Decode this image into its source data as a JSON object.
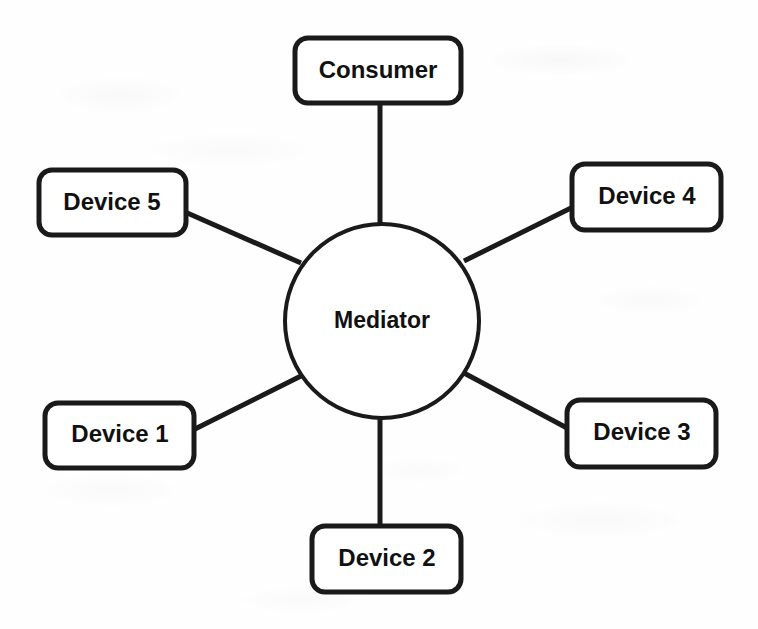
{
  "diagram": {
    "type": "hub-and-spoke",
    "background_color": "#fefefe",
    "stroke_color": "#1a1a1a",
    "fill_color": "#ffffff",
    "hub": {
      "label": "Mediator",
      "shape": "circle",
      "cx": 382,
      "cy": 321,
      "r": 97,
      "stroke_width": 4,
      "font_size": 23
    },
    "nodes": [
      {
        "id": "consumer",
        "label": "Consumer",
        "shape": "rounded-rect",
        "x": 295,
        "y": 38,
        "w": 166,
        "h": 65,
        "rx": 13,
        "stroke_width": 5,
        "font_size": 24
      },
      {
        "id": "device-5",
        "label": "Device 5",
        "shape": "rounded-rect",
        "x": 39,
        "y": 170,
        "w": 147,
        "h": 65,
        "rx": 13,
        "stroke_width": 5,
        "font_size": 24
      },
      {
        "id": "device-4",
        "label": "Device 4",
        "shape": "rounded-rect",
        "x": 572,
        "y": 164,
        "w": 149,
        "h": 66,
        "rx": 13,
        "stroke_width": 5,
        "font_size": 24
      },
      {
        "id": "device-1",
        "label": "Device 1",
        "shape": "rounded-rect",
        "x": 45,
        "y": 403,
        "w": 149,
        "h": 65,
        "rx": 13,
        "stroke_width": 5,
        "font_size": 24
      },
      {
        "id": "device-3",
        "label": "Device 3",
        "shape": "rounded-rect",
        "x": 567,
        "y": 400,
        "w": 149,
        "h": 67,
        "rx": 13,
        "stroke_width": 5,
        "font_size": 24
      },
      {
        "id": "device-2",
        "label": "Device 2",
        "shape": "rounded-rect",
        "x": 312,
        "y": 526,
        "w": 149,
        "h": 66,
        "rx": 13,
        "stroke_width": 5,
        "font_size": 24
      }
    ],
    "edges": [
      {
        "id": "edge-consumer",
        "from": "consumer",
        "to": "mediator",
        "x1": 380,
        "y1": 102,
        "x2": 380,
        "y2": 225,
        "stroke_width": 5
      },
      {
        "id": "edge-device-5",
        "from": "device-5",
        "to": "mediator",
        "x1": 185,
        "y1": 212,
        "x2": 301,
        "y2": 263,
        "stroke_width": 5
      },
      {
        "id": "edge-device-4",
        "from": "device-4",
        "to": "mediator",
        "x1": 573,
        "y1": 207,
        "x2": 464,
        "y2": 261,
        "stroke_width": 5
      },
      {
        "id": "edge-device-1",
        "from": "device-1",
        "to": "mediator",
        "x1": 193,
        "y1": 430,
        "x2": 303,
        "y2": 375,
        "stroke_width": 5
      },
      {
        "id": "edge-device-3",
        "from": "device-3",
        "to": "mediator",
        "x1": 567,
        "y1": 428,
        "x2": 464,
        "y2": 373,
        "stroke_width": 5
      },
      {
        "id": "edge-device-2",
        "from": "device-2",
        "to": "mediator",
        "x1": 380,
        "y1": 526,
        "x2": 380,
        "y2": 417,
        "stroke_width": 5
      }
    ]
  }
}
